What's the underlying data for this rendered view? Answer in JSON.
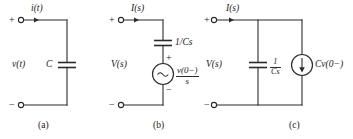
{
  "figure": {
    "type": "circuit-diagram-set",
    "panels": [
      {
        "id": "a",
        "caption": "(a)",
        "current_label": "i(t)",
        "voltage_label": "v(t)",
        "element_label": "C",
        "terminal_plus": "+",
        "terminal_minus": "−"
      },
      {
        "id": "b",
        "caption": "(b)",
        "current_label": "I(s)",
        "voltage_label": "V(s)",
        "impedance_label": "1/Cs",
        "source_type": "voltage-source",
        "source_symbol": "~",
        "source_numerator": "v(0−)",
        "source_denominator": "s",
        "source_plus": "+",
        "source_minus": "−",
        "terminal_plus": "+",
        "terminal_minus": "−"
      },
      {
        "id": "c",
        "caption": "(c)",
        "current_label": "I(s)",
        "voltage_label": "V(s)",
        "impedance_numerator": "1",
        "impedance_denominator": "Cs",
        "source_type": "current-source",
        "source_label": "Cv(0−)",
        "terminal_plus": "+",
        "terminal_minus": "−"
      }
    ],
    "colors": {
      "ink": "#2b2b2b",
      "background": "#ffffff"
    }
  }
}
